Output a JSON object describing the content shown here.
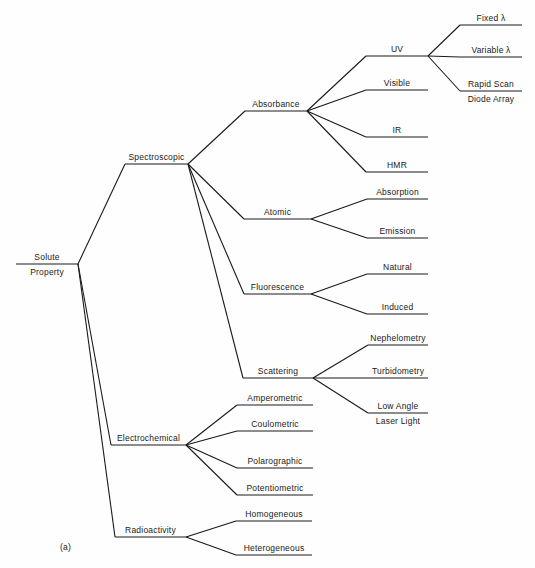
{
  "figure_label": "(a)",
  "tree": {
    "label": "Solute Property",
    "label_lines": [
      "Solute",
      "Property"
    ],
    "children": [
      {
        "label": "Spectroscopic",
        "children": [
          {
            "label": "Absorbance",
            "children": [
              {
                "label": "UV",
                "children": [
                  {
                    "label": "Fixed λ"
                  },
                  {
                    "label": "Variable λ"
                  },
                  {
                    "label": "Rapid Scan Diode Array",
                    "label_lines": [
                      "Rapid Scan",
                      "Diode Array"
                    ]
                  }
                ]
              },
              {
                "label": "Visible"
              },
              {
                "label": "IR"
              },
              {
                "label": "HMR"
              }
            ]
          },
          {
            "label": "Atomic",
            "children": [
              {
                "label": "Absorption"
              },
              {
                "label": "Emission"
              }
            ]
          },
          {
            "label": "Fluorescence",
            "children": [
              {
                "label": "Natural"
              },
              {
                "label": "Induced"
              }
            ]
          },
          {
            "label": "Scattering",
            "children": [
              {
                "label": "Nephelometry"
              },
              {
                "label": "Turbidometry"
              },
              {
                "label": "Low Angle Laser Light",
                "label_lines": [
                  "Low Angle",
                  "Laser Light"
                ]
              }
            ]
          }
        ]
      },
      {
        "label": "Electrochemical",
        "children": [
          {
            "label": "Amperometric"
          },
          {
            "label": "Coulometric"
          },
          {
            "label": "Polarographic"
          },
          {
            "label": "Potentiometric"
          }
        ]
      },
      {
        "label": "Radioactivity",
        "children": [
          {
            "label": "Homogeneous"
          },
          {
            "label": "Heterogeneous"
          }
        ]
      }
    ]
  }
}
